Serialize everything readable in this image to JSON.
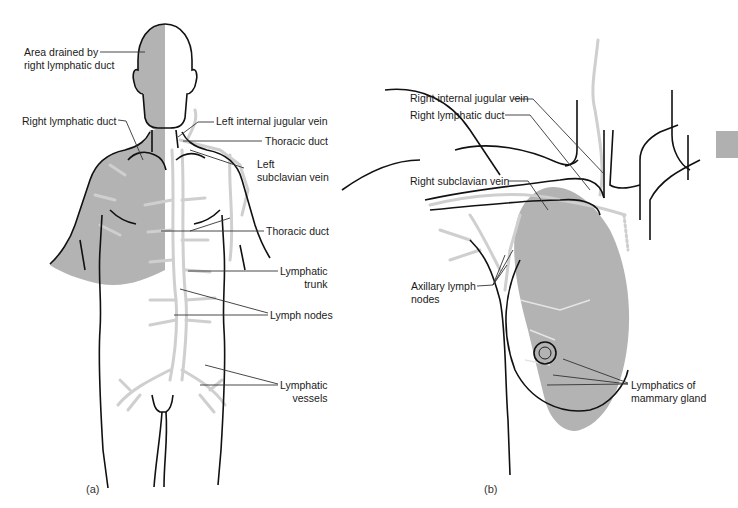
{
  "colors": {
    "shade": "#b3b3b3",
    "lymph": "#cfcfcf",
    "outline": "#111111",
    "leader": "#333333",
    "tab": "#b0b0b0"
  },
  "panel_a": {
    "label": "(a)",
    "callouts": [
      {
        "text": "Area drained by\nright lymphatic duct"
      },
      {
        "text": "Right lymphatic duct"
      },
      {
        "text": "Left internal jugular vein"
      },
      {
        "text": "Thoracic duct"
      },
      {
        "text": "Left\nsubclavian vein"
      },
      {
        "text": "Thoracic duct"
      },
      {
        "text": "Lymphatic\ntrunk"
      },
      {
        "text": "Lymph nodes"
      },
      {
        "text": "Lymphatic\nvessels"
      }
    ]
  },
  "panel_b": {
    "label": "(b)",
    "callouts": [
      {
        "text": "Right internal jugular vein"
      },
      {
        "text": "Right lymphatic duct"
      },
      {
        "text": "Right subclavian vein"
      },
      {
        "text": "Axillary lymph\nnodes"
      },
      {
        "text": "Lymphatics of\nmammary gland"
      }
    ]
  }
}
